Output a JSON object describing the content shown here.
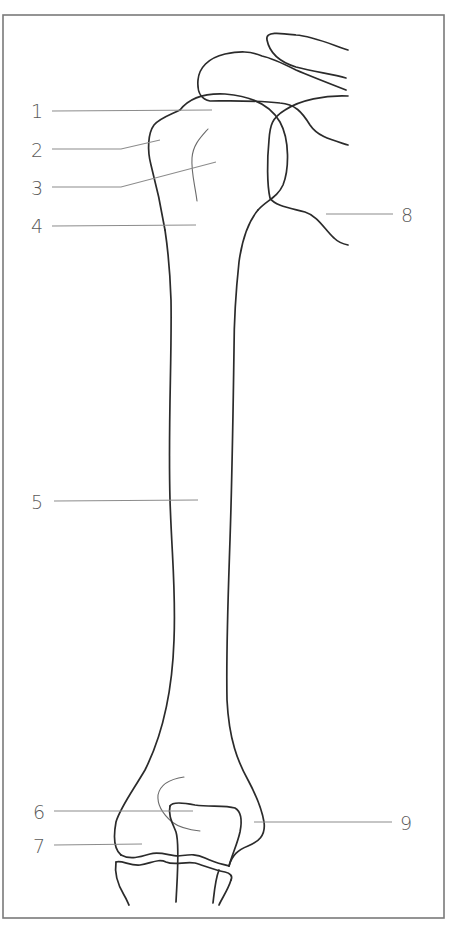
{
  "figure": {
    "frame_color": "#7a7a7a",
    "line_color": "#2b2b2b",
    "label_color": "#5a5a5a"
  },
  "labels": [
    {
      "id": "1",
      "text": "1",
      "side": "left"
    },
    {
      "id": "2",
      "text": "2",
      "side": "left"
    },
    {
      "id": "3",
      "text": "3",
      "side": "left"
    },
    {
      "id": "4",
      "text": "4",
      "side": "left"
    },
    {
      "id": "5",
      "text": "5",
      "side": "left"
    },
    {
      "id": "6",
      "text": "6",
      "side": "left"
    },
    {
      "id": "7",
      "text": "7",
      "side": "left"
    },
    {
      "id": "8",
      "text": "8",
      "side": "right"
    },
    {
      "id": "9",
      "text": "9",
      "side": "right"
    }
  ]
}
